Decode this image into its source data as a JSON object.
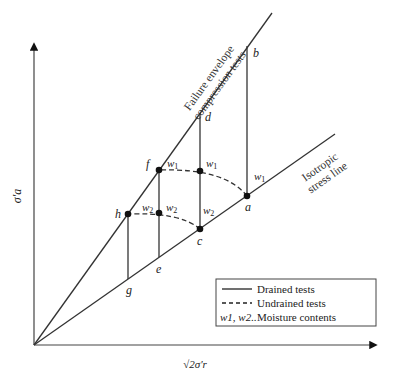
{
  "diagram": {
    "axes": {
      "y_label": "σ′a",
      "x_label": "√2σ′r"
    },
    "lines": {
      "failure_envelope": {
        "label_line1": "Failure envelope",
        "label_line2": "compression tests"
      },
      "isotropic": {
        "label_line1": "Isotropic",
        "label_line2": "stress line"
      }
    },
    "points": {
      "a": "a",
      "b": "b",
      "c": "c",
      "d": "d",
      "e": "e",
      "f": "f",
      "g": "g",
      "h": "h"
    },
    "moisture_labels": {
      "w1": "w",
      "w1_sub": "1",
      "w2": "w",
      "w2_sub": "2"
    },
    "legend": {
      "drained": "Drained tests",
      "undrained": "Undrained tests",
      "moisture_symbol": "w1, w2..",
      "moisture": "Moisture contents"
    },
    "colors": {
      "line": "#333333",
      "dot": "#111111"
    }
  }
}
